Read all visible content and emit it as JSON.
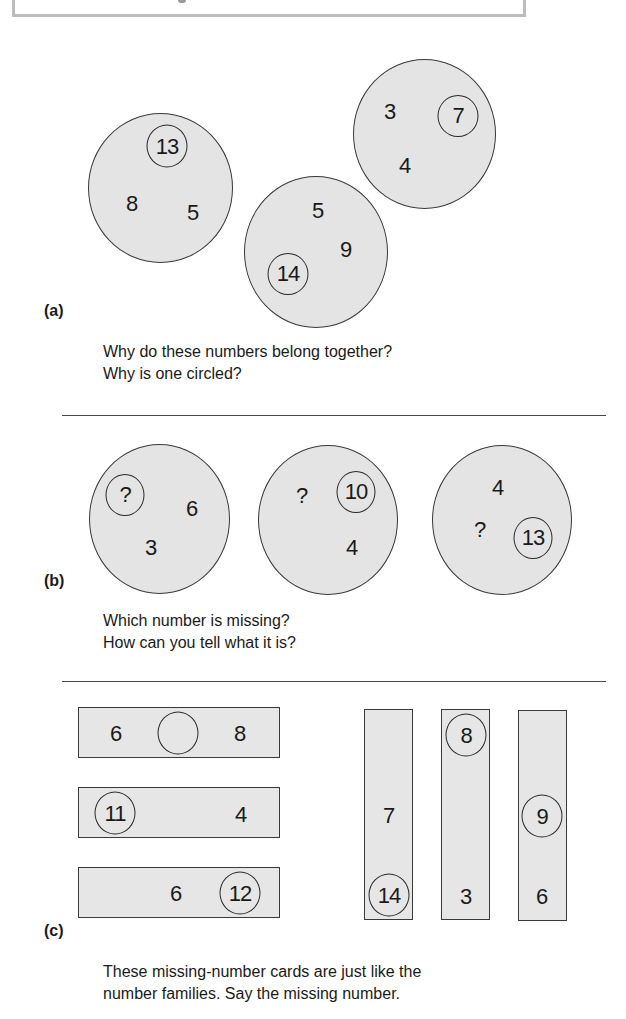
{
  "header_box": {
    "visible_text": ""
  },
  "section_a": {
    "label": "(a)",
    "families": [
      {
        "numbers": [
          "8",
          "5"
        ],
        "circled": "13"
      },
      {
        "numbers": [
          "5",
          "9"
        ],
        "circled": "14"
      },
      {
        "numbers": [
          "3",
          "4"
        ],
        "circled": "7"
      }
    ],
    "caption_line1": "Why do these numbers belong together?",
    "caption_line2": "Why is one circled?"
  },
  "section_b": {
    "label": "(b)",
    "families": [
      {
        "numbers": [
          "6",
          "3"
        ],
        "circled": "?"
      },
      {
        "numbers": [
          "?",
          "4"
        ],
        "circled": "10"
      },
      {
        "numbers": [
          "4",
          "?"
        ],
        "circled": "13"
      }
    ],
    "caption_line1": "Which number is missing?",
    "caption_line2": "How can you tell what it is?"
  },
  "section_c": {
    "label": "(c)",
    "horizontal_cards": [
      {
        "left": "6",
        "circled": "",
        "right": "8"
      },
      {
        "circled": "11",
        "right": "4"
      },
      {
        "middle": "6",
        "circled": "12"
      }
    ],
    "vertical_cards": [
      {
        "middle": "7",
        "circled": "14"
      },
      {
        "circled": "8",
        "bottom": "3"
      },
      {
        "circled": "9",
        "bottom": "6"
      }
    ],
    "caption_line1": "These missing-number cards are just like the",
    "caption_line2": "number families. Say the missing number."
  }
}
